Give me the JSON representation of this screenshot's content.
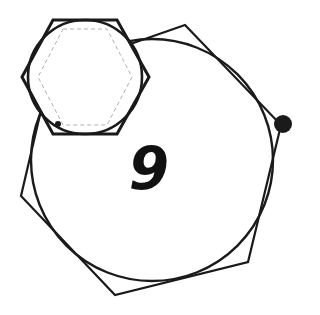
{
  "diagram": {
    "label": "9",
    "colors": {
      "stroke": "#1a1a1a",
      "dashed": "#b0b0b0",
      "background": "#ffffff"
    },
    "shapes": [
      {
        "type": "large-circle",
        "cx": 152,
        "cy": 160,
        "r": 121
      },
      {
        "type": "large-polygon",
        "points": "185,25 281,125 248,262 115,295 21,196 50,72"
      },
      {
        "type": "small-hexagon",
        "points": "53,20 117,20 149,77 117,134 53,134 22,77"
      },
      {
        "type": "small-circle",
        "cx": 85,
        "cy": 77,
        "r": 57
      },
      {
        "type": "dashed-hexagon",
        "points": "63,29 107,29 132,77 107,125 63,125 38,77"
      },
      {
        "type": "small-dot",
        "cx": 58,
        "cy": 124,
        "r": 3
      },
      {
        "type": "large-dot",
        "cx": 283,
        "cy": 124,
        "r": 9
      }
    ]
  }
}
